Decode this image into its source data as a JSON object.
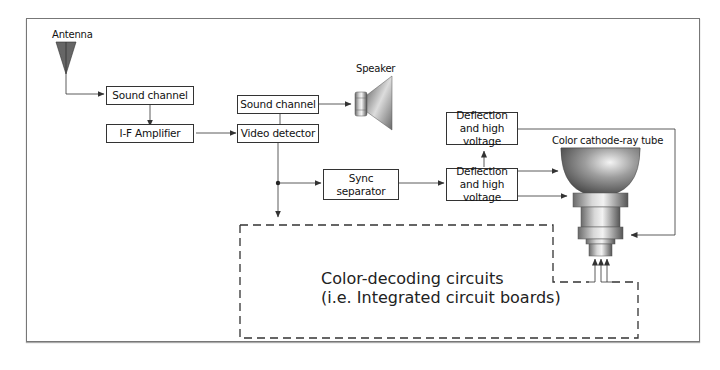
{
  "diagram": {
    "labels": {
      "antenna": "Antenna",
      "speaker": "Speaker",
      "crt": "Color cathode-ray tube"
    },
    "boxes": {
      "sound_channel_1": "Sound channel",
      "if_amplifier": "I-F Amplifier",
      "sound_channel_2": "Sound channel",
      "video_detector": "Video detector",
      "sync_separator": "Sync separator",
      "deflection_top": "Deflection and high voltage",
      "deflection_bottom": "Deflection and high voltage"
    },
    "color_decoding": {
      "line1": "Color-decoding circuits",
      "line2": "(i.e. Integrated circuit boards)"
    },
    "connections": [
      {
        "from": "Antenna",
        "to": "Sound channel"
      },
      {
        "from": "Sound channel",
        "to": "I-F Amplifier"
      },
      {
        "from": "I-F Amplifier",
        "to": "Video detector"
      },
      {
        "from": "Video detector",
        "to": "Sound channel (2)"
      },
      {
        "from": "Sound channel (2)",
        "to": "Speaker"
      },
      {
        "from": "Video detector",
        "to": "Sync separator"
      },
      {
        "from": "Video detector",
        "to": "Color-decoding circuits"
      },
      {
        "from": "Sync separator",
        "to": "Deflection and high voltage (bottom)"
      },
      {
        "from": "Deflection and high voltage (bottom)",
        "to": "Deflection and high voltage (top)"
      },
      {
        "from": "Deflection and high voltage (bottom)",
        "to": "Color cathode-ray tube"
      },
      {
        "from": "Deflection and high voltage (top)",
        "to": "Color cathode-ray tube"
      },
      {
        "from": "Color-decoding circuits",
        "to": "Color cathode-ray tube"
      }
    ],
    "colors": {
      "line": "#333333",
      "antenna_fill": "#666666",
      "frame": "#777777"
    }
  }
}
